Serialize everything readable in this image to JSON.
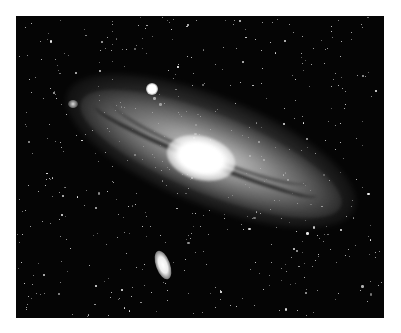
{
  "image": {
    "subject": "Andromeda Galaxy (M31) with satellite galaxies",
    "style": "black-and-white astrophotograph",
    "frame": {
      "left": 16,
      "top": 16,
      "width": 368,
      "height": 302
    },
    "colors": {
      "page_background": "#ffffff",
      "sky": "#050505",
      "core": "#ffffff"
    },
    "features": [
      {
        "name": "galaxy-core",
        "label": "Bright galactic nucleus"
      },
      {
        "name": "satellite-galaxy-upper",
        "label": "Compact satellite galaxy above disk"
      },
      {
        "name": "satellite-galaxy-lower",
        "label": "Elongated satellite galaxy below disk"
      },
      {
        "name": "dust-lanes",
        "label": "Dark dust lanes across disk"
      },
      {
        "name": "star-field",
        "label": "Foreground stars"
      }
    ]
  }
}
